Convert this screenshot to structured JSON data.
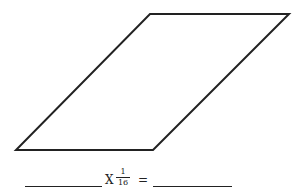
{
  "figure": {
    "shape": "parallelogram",
    "vertices": [
      [
        150,
        14
      ],
      [
        289,
        14
      ],
      [
        153,
        150
      ],
      [
        16,
        150
      ]
    ],
    "stroke_color": "#222222",
    "stroke_width": 2
  },
  "equation": {
    "blank_left": "",
    "operator": "X",
    "fraction": {
      "numerator": "1",
      "denominator": "16"
    },
    "equals": "=",
    "blank_right": ""
  }
}
